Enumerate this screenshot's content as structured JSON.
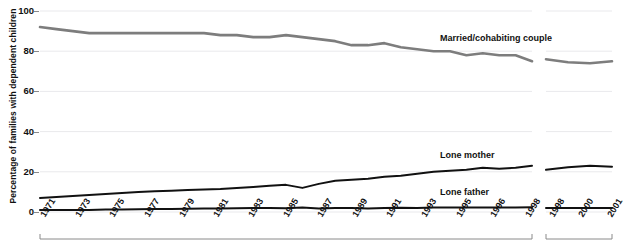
{
  "chart_data": {
    "type": "line",
    "title": "",
    "xlabel": "",
    "ylabel": "Percentage of families with dependent children",
    "ylim": [
      0,
      100
    ],
    "yticks": [
      0,
      20,
      40,
      60,
      80,
      100
    ],
    "grid": true,
    "legend_position": "inline-annotations",
    "panels": [
      {
        "name": "panel-1971-1998",
        "categories": [
          "1971",
          "1972",
          "1973",
          "1974",
          "1975",
          "1976",
          "1977",
          "1978",
          "1979",
          "1980",
          "1981",
          "1982",
          "1983",
          "1984",
          "1985",
          "1986",
          "1987",
          "1988",
          "1989",
          "1990",
          "1991",
          "1992",
          "1993",
          "1994",
          "1995",
          "1996",
          "1998"
        ],
        "tick_labels": [
          "1971",
          "1973",
          "1975",
          "1977",
          "1979",
          "1981",
          "1983",
          "1985",
          "1987",
          "1989",
          "1991",
          "1993",
          "1995",
          "1996",
          "1998"
        ],
        "series": [
          {
            "name": "Married/cohabiting couple",
            "color": "#7d7d7d",
            "values": [
              92,
              91,
              90,
              89,
              89,
              89,
              89,
              89,
              89,
              89,
              89,
              88,
              88,
              87,
              87,
              88,
              87,
              86,
              85,
              83,
              83,
              84,
              82,
              81,
              80,
              80,
              78,
              79,
              78,
              78,
              75
            ]
          },
          {
            "name": "Lone mother",
            "color": "#111111",
            "values": [
              7,
              7.5,
              8,
              8.5,
              9,
              9.5,
              10,
              10.3,
              10.6,
              11,
              11.2,
              11.5,
              12,
              12.5,
              13,
              13.5,
              12,
              14,
              15.5,
              16,
              16.5,
              17.5,
              18,
              19,
              20,
              20.5,
              21,
              22,
              21.5,
              22,
              23
            ]
          },
          {
            "name": "Lone father",
            "color": "#111111",
            "values": [
              1,
              1,
              1,
              1,
              1.2,
              1.3,
              1.4,
              1.5,
              1.5,
              1.6,
              1.7,
              1.8,
              1.9,
              2,
              2,
              1.9,
              2.2,
              1.8,
              2,
              2,
              1.8,
              2,
              2.1,
              2,
              2.2,
              2.2,
              2.3,
              2.2,
              2.3,
              2.3,
              2.4
            ]
          }
        ]
      },
      {
        "name": "panel-1998-2001",
        "categories": [
          "1998",
          "1999",
          "2000",
          "2001"
        ],
        "tick_labels": [
          "1998",
          "2000",
          "2001"
        ],
        "series": [
          {
            "name": "Married/cohabiting couple",
            "color": "#7d7d7d",
            "values": [
              76,
              74.5,
              74,
              75
            ]
          },
          {
            "name": "Lone mother",
            "color": "#111111",
            "values": [
              21,
              22.3,
              23,
              22.5
            ]
          },
          {
            "name": "Lone father",
            "color": "#111111",
            "values": [
              2,
              2,
              2,
              2
            ]
          }
        ]
      }
    ],
    "annotations": [
      {
        "text": "Married/cohabiting couple",
        "x_px": 440,
        "y_px": 33
      },
      {
        "text": "Lone mother",
        "x_px": 440,
        "y_px": 150
      },
      {
        "text": "Lone father",
        "x_px": 440,
        "y_px": 187
      }
    ]
  },
  "axis": {
    "y_ticks": [
      {
        "label": "100",
        "value": 100
      },
      {
        "label": "80",
        "value": 80
      },
      {
        "label": "60",
        "value": 60
      },
      {
        "label": "40",
        "value": 40
      },
      {
        "label": "20",
        "value": 20
      },
      {
        "label": "0",
        "value": 0
      }
    ],
    "y_title": "Percentage of families with dependent children",
    "x_ticks_panel1": [
      "1971",
      "1973",
      "1975",
      "1977",
      "1979",
      "1981",
      "1983",
      "1985",
      "1987",
      "1989",
      "1991",
      "1993",
      "1995",
      "1996",
      "1998"
    ],
    "x_ticks_panel2": [
      "1998",
      "2000",
      "2001"
    ]
  },
  "colors": {
    "married_line": "#7d7d7d",
    "lone_line": "#111111",
    "grid": "#e9e9ec",
    "axis_rule": "#8a8a8a",
    "text": "#111111",
    "background": "#ffffff"
  }
}
